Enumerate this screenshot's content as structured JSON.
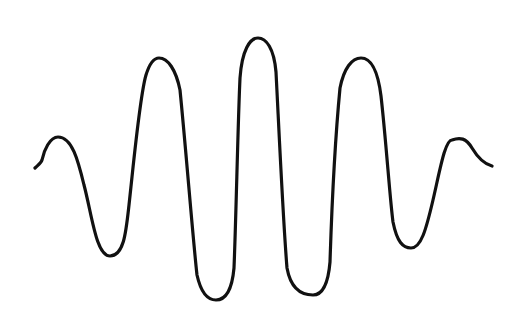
{
  "figure": {
    "stroke_color": "#111111",
    "background": "#ffffff",
    "stroke_width": 3.2
  },
  "waveform": {
    "extrema": [
      {
        "type": "start",
        "x": 35,
        "y": 168
      },
      {
        "type": "peak",
        "x": 58,
        "y": 137
      },
      {
        "type": "trough",
        "x": 110,
        "y": 256
      },
      {
        "type": "peak",
        "x": 159,
        "y": 58
      },
      {
        "type": "trough",
        "x": 216,
        "y": 300
      },
      {
        "type": "peak",
        "x": 258,
        "y": 38
      },
      {
        "type": "trough",
        "x": 313,
        "y": 295
      },
      {
        "type": "peak",
        "x": 361,
        "y": 58
      },
      {
        "type": "trough",
        "x": 411,
        "y": 248
      },
      {
        "type": "peak",
        "x": 461,
        "y": 138
      },
      {
        "type": "end",
        "x": 492,
        "y": 166
      }
    ]
  }
}
